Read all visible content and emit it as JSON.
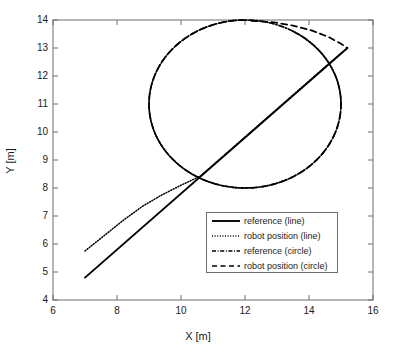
{
  "chart_data": {
    "type": "line",
    "title": "",
    "xlabel": "X [m]",
    "ylabel": "Y [m]",
    "xlim": [
      6,
      16
    ],
    "ylim": [
      4,
      14
    ],
    "xticks": [
      6,
      8,
      10,
      12,
      14,
      16
    ],
    "yticks": [
      4,
      5,
      6,
      7,
      8,
      9,
      10,
      11,
      12,
      13,
      14
    ],
    "grid": false,
    "legend_position": "center-right-inside",
    "series": [
      {
        "name": "reference (line)",
        "style": "solid",
        "color": "#000000",
        "description": "Straight reference segment from (7.0, 4.8) to (15.2, 13.0)",
        "points": [
          [
            7.0,
            4.8
          ],
          [
            15.2,
            13.0
          ]
        ]
      },
      {
        "name": "robot position (line)",
        "style": "dotted",
        "color": "#000000",
        "description": "Robot track starting above the reference at (7.0, 5.75), converging onto the reference near (10.6, 8.4) and following it to (15.2, 13.0)",
        "points": [
          [
            7.0,
            5.75
          ],
          [
            7.6,
            6.3
          ],
          [
            8.2,
            6.85
          ],
          [
            8.8,
            7.35
          ],
          [
            9.4,
            7.75
          ],
          [
            10.0,
            8.1
          ],
          [
            10.6,
            8.42
          ],
          [
            11.4,
            9.22
          ],
          [
            12.2,
            10.02
          ],
          [
            13.0,
            10.82
          ],
          [
            13.8,
            11.62
          ],
          [
            14.6,
            12.42
          ],
          [
            15.2,
            13.0
          ]
        ]
      },
      {
        "name": "reference (circle)",
        "style": "dashdot",
        "color": "#000000",
        "description": "Circular reference path, center (12, 11), radius 3",
        "circle": {
          "cx": 12,
          "cy": 11,
          "r": 3
        }
      },
      {
        "name": "robot position (circle)",
        "style": "dashed",
        "color": "#000000",
        "description": "Robot track overlapping the circular reference except near the upper-right where it bulges outward toward (15.2, 13.0)",
        "circle": {
          "cx": 12,
          "cy": 11,
          "r": 3
        },
        "deviation": [
          [
            12.2,
            13.97
          ],
          [
            12.9,
            13.92
          ],
          [
            13.5,
            13.8
          ],
          [
            14.1,
            13.62
          ],
          [
            14.6,
            13.4
          ],
          [
            15.0,
            13.15
          ],
          [
            15.2,
            13.0
          ]
        ]
      }
    ],
    "legend": [
      {
        "label": "reference (line)",
        "style": "solid"
      },
      {
        "label": "robot position (line)",
        "style": "dotted"
      },
      {
        "label": "reference (circle)",
        "style": "dashdot"
      },
      {
        "label": "robot position (circle)",
        "style": "dashed"
      }
    ]
  },
  "axes": {
    "x_label": "X [m]",
    "y_label": "Y [m]",
    "x_tick_labels": [
      "6",
      "8",
      "10",
      "12",
      "14",
      "16"
    ],
    "y_tick_labels": [
      "14",
      "13",
      "12",
      "11",
      "10",
      "9",
      "8",
      "7",
      "6",
      "5",
      "4"
    ]
  },
  "colors": {
    "line": "#000000",
    "axis": "#6e6e6e",
    "text": "#1a1a1a",
    "background": "#ffffff"
  }
}
